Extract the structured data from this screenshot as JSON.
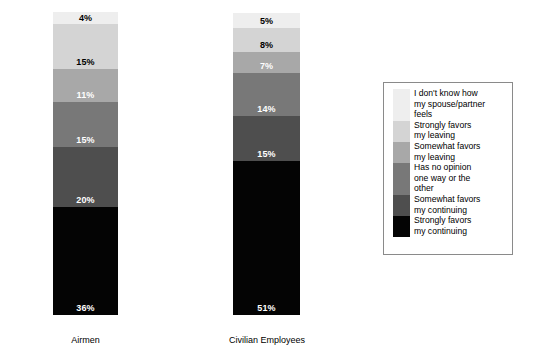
{
  "chart_data": {
    "type": "bar",
    "subtype": "stacked-percentage-column",
    "title": "",
    "subtitle": "",
    "xlabel": "",
    "ylabel": "",
    "ylim": [
      0,
      100
    ],
    "grid": false,
    "legend_position": "right",
    "value_suffix": "%",
    "categories": [
      "Airmen",
      "Civilian Employees"
    ],
    "series": [
      {
        "name": "I don't know how my spouse/partner feels",
        "color": "#eeeeee",
        "label_color": "#000000",
        "values": [
          4,
          5
        ]
      },
      {
        "name": "Strongly favors my leaving",
        "color": "#d4d4d4",
        "label_color": "#000000",
        "values": [
          15,
          8
        ]
      },
      {
        "name": "Somewhat favors my leaving",
        "color": "#a8a8a8",
        "label_color": "#ffffff",
        "values": [
          11,
          7
        ]
      },
      {
        "name": "Has no opinion one way or the other",
        "color": "#787878",
        "label_color": "#ffffff",
        "values": [
          15,
          14
        ]
      },
      {
        "name": "Somewhat favors my continuing",
        "color": "#4e4e4e",
        "label_color": "#ffffff",
        "values": [
          20,
          15
        ]
      },
      {
        "name": "Strongly favors my continuing",
        "color": "#040404",
        "label_color": "#ffffff",
        "values": [
          36,
          51
        ]
      }
    ]
  },
  "legend": {
    "items": [
      {
        "label": "I don't know how\nmy spouse/partner\nfeels",
        "color": "#eeeeee",
        "lines": 3
      },
      {
        "label": "Strongly favors\nmy leaving",
        "color": "#d4d4d4",
        "lines": 2
      },
      {
        "label": "Somewhat favors\nmy leaving",
        "color": "#a8a8a8",
        "lines": 2
      },
      {
        "label": "Has no opinion\none way or the\nother",
        "color": "#787878",
        "lines": 3
      },
      {
        "label": "Somewhat favors\nmy continuing",
        "color": "#4e4e4e",
        "lines": 2
      },
      {
        "label": "Strongly favors\nmy continuing",
        "color": "#040404",
        "lines": 2
      }
    ]
  },
  "bars": [
    {
      "category": "Airmen",
      "segments": [
        {
          "value_label": "4%",
          "value": 4,
          "color": "#eeeeee",
          "label_color": "#000000"
        },
        {
          "value_label": "15%",
          "value": 15,
          "color": "#d4d4d4",
          "label_color": "#000000"
        },
        {
          "value_label": "11%",
          "value": 11,
          "color": "#a8a8a8",
          "label_color": "#ffffff"
        },
        {
          "value_label": "15%",
          "value": 15,
          "color": "#787878",
          "label_color": "#ffffff"
        },
        {
          "value_label": "20%",
          "value": 20,
          "color": "#4e4e4e",
          "label_color": "#ffffff"
        },
        {
          "value_label": "36%",
          "value": 36,
          "color": "#040404",
          "label_color": "#ffffff"
        }
      ]
    },
    {
      "category": "Civilian Employees",
      "segments": [
        {
          "value_label": "5%",
          "value": 5,
          "color": "#eeeeee",
          "label_color": "#000000"
        },
        {
          "value_label": "8%",
          "value": 8,
          "color": "#d4d4d4",
          "label_color": "#000000"
        },
        {
          "value_label": "7%",
          "value": 7,
          "color": "#a8a8a8",
          "label_color": "#ffffff"
        },
        {
          "value_label": "14%",
          "value": 14,
          "color": "#787878",
          "label_color": "#ffffff"
        },
        {
          "value_label": "15%",
          "value": 15,
          "color": "#4e4e4e",
          "label_color": "#ffffff"
        },
        {
          "value_label": "51%",
          "value": 51,
          "color": "#040404",
          "label_color": "#ffffff"
        }
      ]
    }
  ],
  "axis": {
    "category_labels": [
      "Airmen",
      "Civilian Employees"
    ]
  }
}
